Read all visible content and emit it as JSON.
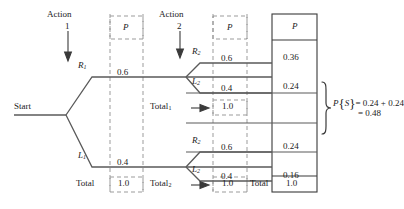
{
  "diagram": {
    "type": "probability-tree",
    "title": "",
    "start_label": "Start",
    "stage_headers": [
      {
        "name": "Action",
        "number": "1"
      },
      {
        "name": "Action",
        "number": "2"
      }
    ],
    "column_headers": {
      "stage1_p": "P",
      "stage2_p": "P",
      "joint_p": "P"
    },
    "branches": {
      "stage1": [
        {
          "node": "R",
          "subscript": "1",
          "p": "0.6"
        },
        {
          "node": "L",
          "subscript": "1",
          "p": "0.4"
        }
      ],
      "stage2_upper": [
        {
          "node": "R",
          "subscript": "2",
          "p": "0.6"
        },
        {
          "node": "L",
          "subscript": "2",
          "p": "0.4"
        }
      ],
      "stage2_lower": [
        {
          "node": "R",
          "subscript": "2",
          "p": "0.6"
        },
        {
          "node": "L",
          "subscript": "2",
          "p": "0.4"
        }
      ]
    },
    "joint_probabilities": [
      {
        "path": "R1-R2",
        "value": "0.36"
      },
      {
        "path": "R1-L2",
        "value": "0.24"
      },
      {
        "path": "L1-R2",
        "value": "0.24"
      },
      {
        "path": "L1-L2",
        "value": "0.16"
      }
    ],
    "totals": {
      "stage1_total_label": "Total",
      "stage1_total_value": "1.0",
      "upper_total_label": "Total",
      "upper_total_subscript": "1",
      "upper_total_value": "1.0",
      "lower_total_label": "Total",
      "lower_total_subscript": "2",
      "lower_total_value": "1.0",
      "joint_total_label": "Total",
      "joint_total_value": "1.0"
    },
    "annotation": {
      "symbol_p": "P",
      "brace_open": "{",
      "event": "S",
      "brace_close": "}",
      "line1": "= 0.24 + 0.24",
      "line2": "= 0.48"
    },
    "colors": {
      "line": "#5a5a5a",
      "dashed": "#8c8c8c",
      "box": "#3a3a3a",
      "text": "#1a1a1a"
    }
  }
}
